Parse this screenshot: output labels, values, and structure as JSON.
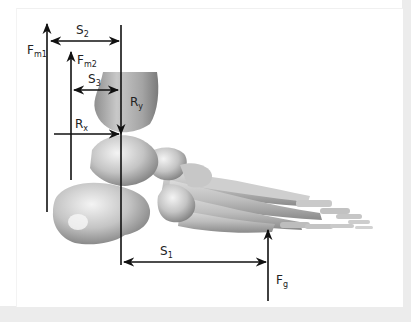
{
  "figure": {
    "colors": {
      "background": "#ffffff",
      "frame": "#ececec",
      "arrow": "#111111",
      "bone_light": "#e6e6e6",
      "bone_mid": "#b5b5b5",
      "bone_dark": "#7d7d7d"
    },
    "labels": {
      "fm1": {
        "main": "F",
        "sub": "m1"
      },
      "fm2": {
        "main": "F",
        "sub": "m2"
      },
      "s2": {
        "main": "S",
        "sub": "2"
      },
      "s3": {
        "main": "S",
        "sub": "3"
      },
      "ry": {
        "main": "R",
        "sub": "y"
      },
      "rx": {
        "main": "R",
        "sub": "x"
      },
      "s1": {
        "main": "S",
        "sub": "1"
      },
      "fg": {
        "main": "F",
        "sub": "g"
      }
    }
  }
}
